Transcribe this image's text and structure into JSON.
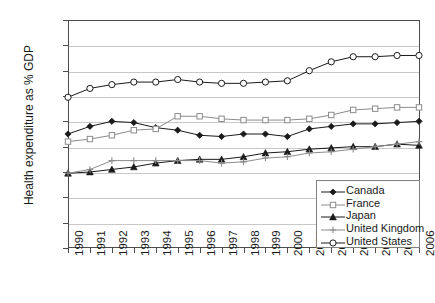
{
  "chart_data": {
    "type": "line",
    "title": "",
    "xlabel": "",
    "ylabel": "Health expenditure as % GDP",
    "grid": true,
    "legend_position": "bottom-right",
    "ylim": [
      0.0,
      18.0
    ],
    "ytick_step": 2.0,
    "yticks": [
      "0.0",
      "2.0",
      "4.0",
      "6.0",
      "8.0",
      "10.0",
      "12.0",
      "14.0",
      "16.0",
      "18.0"
    ],
    "categories": [
      "1990",
      "1991",
      "1992",
      "1993",
      "1994",
      "1995",
      "1996",
      "1997",
      "1998",
      "1999",
      "2000",
      "2001",
      "2002",
      "2003",
      "2004",
      "2005",
      "2006"
    ],
    "series": [
      {
        "name": "Canada",
        "marker": "filled-diamond",
        "color": "#1a1a1a",
        "values": [
          9.0,
          9.6,
          10.0,
          9.9,
          9.5,
          9.3,
          8.9,
          8.8,
          9.0,
          9.0,
          8.8,
          9.4,
          9.6,
          9.8,
          9.8,
          9.9,
          10.0
        ]
      },
      {
        "name": "France",
        "marker": "open-square",
        "color": "#8c8c8c",
        "values": [
          8.4,
          8.6,
          8.9,
          9.3,
          9.4,
          10.4,
          10.4,
          10.2,
          10.1,
          10.1,
          10.1,
          10.2,
          10.5,
          10.9,
          11.0,
          11.1,
          11.1
        ]
      },
      {
        "name": "Japan",
        "marker": "filled-triangle",
        "color": "#1a1a1a",
        "values": [
          5.9,
          6.0,
          6.2,
          6.4,
          6.7,
          6.9,
          7.0,
          7.0,
          7.2,
          7.5,
          7.6,
          7.8,
          7.9,
          8.0,
          8.0,
          8.2,
          8.1
        ]
      },
      {
        "name": "United Kingdom",
        "marker": "plus",
        "color": "#8c8c8c",
        "values": [
          5.9,
          6.2,
          6.9,
          6.9,
          6.9,
          6.9,
          6.9,
          6.7,
          6.8,
          7.1,
          7.2,
          7.5,
          7.6,
          7.8,
          8.0,
          8.2,
          8.4
        ]
      },
      {
        "name": "United States",
        "marker": "open-circle",
        "color": "#1a1a1a",
        "values": [
          11.9,
          12.6,
          12.9,
          13.1,
          13.1,
          13.3,
          13.1,
          13.0,
          13.0,
          13.1,
          13.2,
          14.0,
          14.7,
          15.1,
          15.1,
          15.2,
          15.2
        ]
      }
    ]
  },
  "legend": {
    "items": [
      "Canada",
      "France",
      "Japan",
      "United Kingdom",
      "United States"
    ]
  }
}
